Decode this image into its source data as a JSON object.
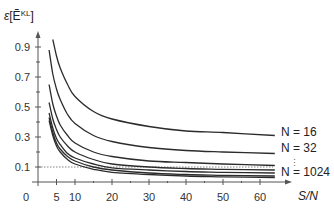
{
  "chart_data": {
    "type": "line",
    "title": "",
    "ylabel": "ε[Ẽ^KL]",
    "xlabel": "S/N",
    "xlim": [
      0,
      65
    ],
    "ylim": [
      0,
      1.0
    ],
    "x_ticks": [
      0,
      5,
      10,
      20,
      30,
      40,
      50,
      60
    ],
    "y_ticks": [
      0.1,
      0.3,
      0.5,
      0.7,
      0.9
    ],
    "reference_line": {
      "y": 0.1,
      "style": "dotted"
    },
    "grid": false,
    "x": [
      3,
      4,
      5,
      6,
      8,
      10,
      15,
      20,
      30,
      40,
      50,
      64
    ],
    "series": [
      {
        "name": "N = 16",
        "values": [
          null,
          0.95,
          0.84,
          0.76,
          0.65,
          0.57,
          0.47,
          0.42,
          0.37,
          0.34,
          0.33,
          0.31
        ]
      },
      {
        "name": "N = 32",
        "values": [
          0.88,
          0.72,
          0.62,
          0.55,
          0.45,
          0.39,
          0.31,
          0.27,
          0.23,
          0.21,
          0.2,
          0.19
        ]
      },
      {
        "name": "N = 64",
        "values": [
          0.65,
          0.52,
          0.44,
          0.38,
          0.31,
          0.26,
          0.2,
          0.17,
          0.14,
          0.13,
          0.12,
          0.11
        ]
      },
      {
        "name": "N = 128",
        "values": [
          0.53,
          0.42,
          0.35,
          0.3,
          0.24,
          0.2,
          0.15,
          0.12,
          0.1,
          0.09,
          0.085,
          0.08
        ]
      },
      {
        "name": "N = 256",
        "values": [
          0.46,
          0.36,
          0.29,
          0.25,
          0.19,
          0.16,
          0.12,
          0.095,
          0.08,
          0.07,
          0.065,
          0.06
        ]
      },
      {
        "name": "N = 512",
        "values": [
          0.43,
          0.33,
          0.26,
          0.22,
          0.17,
          0.14,
          0.1,
          0.08,
          0.06,
          0.05,
          0.045,
          0.04
        ]
      },
      {
        "name": "N = 1024",
        "values": [
          0.41,
          0.31,
          0.24,
          0.2,
          0.15,
          0.12,
          0.085,
          0.065,
          0.05,
          0.04,
          0.035,
          0.03
        ]
      }
    ],
    "annotations": [
      "N = 16",
      "N = 32",
      "⋮",
      "N = 1024"
    ]
  },
  "labels": {
    "y_axis": "ε[Ẽ",
    "y_axis_sup": "KL",
    "y_axis_close": "]",
    "x_axis": "S/N",
    "n16": "N = 16",
    "n32": "N = 32",
    "dots": "⋮",
    "n1024": "N = 1024"
  }
}
